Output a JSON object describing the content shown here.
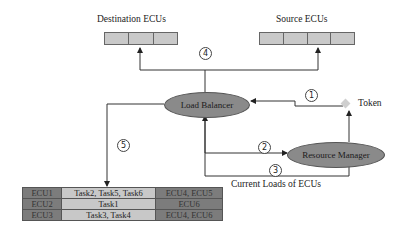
{
  "diagram": {
    "destination_ecus": {
      "label": "Destination ECUs",
      "slots": 3
    },
    "source_ecus": {
      "label": "Source ECUs",
      "slots": 4
    },
    "load_balancer": {
      "label": "Load Balancer"
    },
    "resource_manager": {
      "label": "Resource Manager"
    },
    "token": {
      "label": "Token"
    },
    "current_loads_label": "Current Loads of ECUs",
    "steps": [
      "1",
      "2",
      "3",
      "4",
      "5"
    ],
    "colors": {
      "node_fill": "#8a8a8a",
      "slot_fill": "#c9c9c9",
      "token_fill": "#cfcfcf",
      "table_dark": "#7c7c7c",
      "table_light": "#c8c8c8"
    },
    "table": {
      "rows": [
        [
          "ECU1",
          "Task2, Task5, Task6",
          "ECU4, ECU5"
        ],
        [
          "ECU2",
          "Task1",
          "ECU6"
        ],
        [
          "ECU3",
          "Task3, Task4",
          "ECU4, ECU6"
        ]
      ]
    }
  }
}
